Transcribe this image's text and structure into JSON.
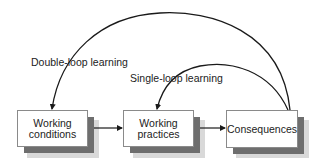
{
  "diagram": {
    "type": "flow",
    "nodes": [
      {
        "id": "working_conditions",
        "label": "Working\nconditions",
        "line1": "Working",
        "line2": "conditions"
      },
      {
        "id": "working_practices",
        "label": "Working\npractices",
        "line1": "Working",
        "line2": "practices"
      },
      {
        "id": "consequences",
        "label": "Consequences"
      }
    ],
    "edges": [
      {
        "from": "working_conditions",
        "to": "working_practices"
      },
      {
        "from": "working_practices",
        "to": "consequences"
      },
      {
        "from": "consequences",
        "to": "working_practices",
        "label": "Single-loop learning",
        "style": "curved"
      },
      {
        "from": "consequences",
        "to": "working_conditions",
        "label": "Double-loop learning",
        "style": "curved"
      }
    ],
    "loops": {
      "double": "Double-loop learning",
      "single": "Single-loop learning"
    },
    "colors": {
      "line": "#1a1a1a",
      "box_border": "#8a8a8a",
      "shadow": "#6e6e6e",
      "background": "#ffffff"
    }
  }
}
